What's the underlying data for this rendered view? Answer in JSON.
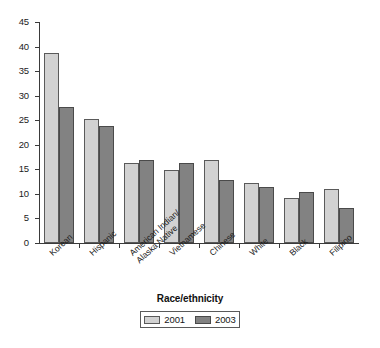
{
  "chart_data": {
    "type": "bar",
    "title": "",
    "xlabel": "Race/ethnicity",
    "ylabel": "",
    "categories": [
      "Korean",
      "Hispanic",
      "American Indian/ Alaska Native",
      "Vietnamese",
      "Chinese",
      "White",
      "Black",
      "Filipino"
    ],
    "categories_lines": [
      [
        "Korean"
      ],
      [
        "Hispanic"
      ],
      [
        "American Indian/",
        "Alaska Native"
      ],
      [
        "Vietnamese"
      ],
      [
        "Chinese"
      ],
      [
        "White"
      ],
      [
        "Black"
      ],
      [
        "Filipino"
      ]
    ],
    "series": [
      {
        "name": "2001",
        "color": "#d2d2d2",
        "values": [
          38.6,
          25.3,
          16.2,
          14.8,
          16.8,
          12.2,
          9.2,
          10.9
        ]
      },
      {
        "name": "2003",
        "color": "#828282",
        "values": [
          27.6,
          23.8,
          16.8,
          16.2,
          12.9,
          11.4,
          10.4,
          7.1
        ]
      }
    ],
    "ylim": [
      0,
      45
    ],
    "ytick_values": [
      0,
      5,
      10,
      15,
      20,
      25,
      30,
      35,
      40,
      45
    ],
    "ytick_labels": [
      "0",
      "5",
      "10",
      "15",
      "20",
      "25",
      "30",
      "35",
      "40",
      "45"
    ],
    "grid": false,
    "legend_position": "bottom",
    "legend_entries": [
      "2001",
      "2003"
    ]
  }
}
